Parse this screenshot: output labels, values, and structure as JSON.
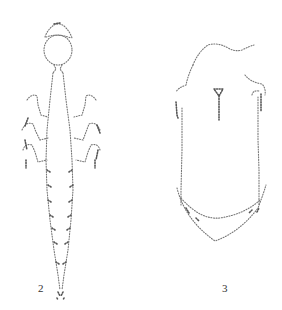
{
  "figures": [
    {
      "id": "figure-2",
      "label": "2",
      "description": "stippled drawing of elongated larva, dorsal view, head with cap, three pairs of legs, segmented tapering abdomen"
    },
    {
      "id": "figure-3",
      "label": "3",
      "description": "stippled drawing of oval larva, dorsal view, with T-shaped median mark and lateral appendages"
    }
  ],
  "colors": {
    "background": "#ffffff",
    "ink": "#777777"
  }
}
